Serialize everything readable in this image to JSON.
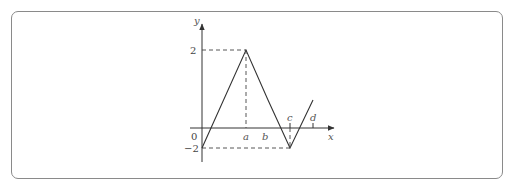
{
  "diagram": {
    "type": "piecewise-linear-function-graph",
    "axes": {
      "x_label": "x",
      "y_label": "y",
      "origin_label": "0"
    },
    "y_ticks": [
      {
        "value": 2,
        "label": "2"
      },
      {
        "value": -2,
        "label": "−2"
      }
    ],
    "x_points": [
      {
        "name": "a",
        "label": "a"
      },
      {
        "name": "b",
        "label": "b"
      },
      {
        "name": "c",
        "label": "c"
      },
      {
        "name": "d",
        "label": "d"
      }
    ],
    "graph_points": [
      {
        "x": "0",
        "y": -2
      },
      {
        "x": "a",
        "y": 2
      },
      {
        "x": "b",
        "y": 0
      },
      {
        "x": "c",
        "y": -2
      },
      {
        "x": "d",
        "y": 0
      }
    ],
    "guides": [
      "dashed horizontal from y-axis at 2 to peak at x=a",
      "dashed vertical from peak down to x-axis at a",
      "dashed vertical from c on x-axis down to trough",
      "dashed horizontal from y-axis at -2 to trough at x=c"
    ]
  }
}
